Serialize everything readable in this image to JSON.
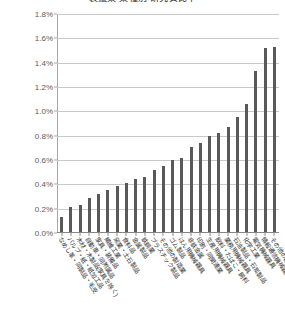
{
  "chart_data": {
    "type": "bar",
    "title": "製造業 業種別 研究費比率",
    "subtitle": "",
    "xlabel": "",
    "ylabel": "",
    "ylim": [
      0.0,
      1.8
    ],
    "ytick_step": 0.2,
    "yunit": "%",
    "grid": true,
    "legend": false,
    "legend_position": "none",
    "orientation": "vertical",
    "sorted": "ascending",
    "bar_color": "#595959",
    "gridline_color": "#c9c9c9",
    "axis_color": "#a6a6a6",
    "ytick_labels": [
      "0.0%",
      "0.2%",
      "0.4%",
      "0.6%",
      "0.8%",
      "1.0%",
      "1.2%",
      "1.4%",
      "1.6%",
      "1.8%"
    ],
    "ytick_values": [
      0.0,
      0.2,
      0.4,
      0.6,
      0.8,
      1.0,
      1.2,
      1.4,
      1.6,
      1.8
    ],
    "categories": [
      "なめし革・同製品・毛皮",
      "パルプ・紙・紙加工品",
      "木材・木製品(家具を除く)",
      "自動車・同附属品",
      "家具・装備品",
      "繊維工業",
      "窯業・土石製品",
      "食料品",
      "金属製品",
      "鉄鋼業",
      "プラスチック製品",
      "その他の製造業",
      "ゴム製品",
      "はん用機械器具",
      "非鉄金属",
      "印刷・同関連業",
      "生産用機械器具",
      "飲料・たばこ・飼料",
      "業務用機械器具",
      "石油製品・石炭製品",
      "化学工業",
      "電気機械器具",
      "情報通信機械器具",
      "その他の輸送用機械器具"
    ],
    "values": [
      0.13,
      0.21,
      0.23,
      0.29,
      0.32,
      0.35,
      0.39,
      0.41,
      0.44,
      0.46,
      0.52,
      0.55,
      0.6,
      0.62,
      0.71,
      0.74,
      0.8,
      0.82,
      0.87,
      0.95,
      1.06,
      1.33,
      1.52,
      1.53
    ],
    "value_unit": "%",
    "bar_count": 24
  }
}
